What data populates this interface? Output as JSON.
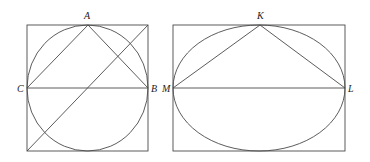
{
  "figures": [
    {
      "name": "circle-in-square",
      "labels": {
        "A": "A",
        "B": "B",
        "C": "C"
      }
    },
    {
      "name": "ellipse-in-rectangle",
      "labels": {
        "K": "K",
        "L": "L",
        "M": "M"
      }
    }
  ],
  "colors": {
    "stroke": "#4a4a4a",
    "label": "#222222",
    "background": "#ffffff"
  }
}
